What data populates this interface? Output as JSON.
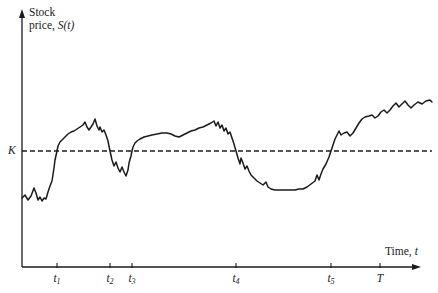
{
  "figure": {
    "name": "stock-price-path-with-strike-level",
    "background_color": "#ffffff",
    "line_color": "#1a1a1a",
    "width": 438,
    "height": 293
  },
  "axes": {
    "y_title_line1": "Stock",
    "y_title_line2_prefix": "price, ",
    "y_title_line2_symbol": "S(t)",
    "x_title_prefix": "Time, ",
    "x_title_symbol": "t",
    "strike_label": "K",
    "origin_x": 22,
    "origin_y": 267,
    "y_axis_top": 12,
    "x_axis_right": 420
  },
  "ticks": [
    {
      "label": "t",
      "sub": "1",
      "x": 57
    },
    {
      "label": "t",
      "sub": "2",
      "x": 110
    },
    {
      "label": "t",
      "sub": "3",
      "x": 132
    },
    {
      "label": "t",
      "sub": "4",
      "x": 236
    },
    {
      "label": "t",
      "sub": "5",
      "x": 331
    },
    {
      "label": "T",
      "sub": "",
      "x": 380
    }
  ],
  "strike_line": {
    "name": "strike-price-dashed-line",
    "y": 151,
    "x_start": 22,
    "x_end": 432,
    "dash": "5 3",
    "width": 1.6
  },
  "chart_data": {
    "type": "line",
    "title": "",
    "xlabel": "Time, t",
    "ylabel": "Stock price, S(t)",
    "legend": [],
    "grid": false,
    "annotations": [
      {
        "text": "K",
        "type": "horizontal-threshold",
        "y_pixel": 151
      },
      {
        "text": "t1",
        "type": "upcrossing",
        "x_pixel": 57
      },
      {
        "text": "t2",
        "type": "downcrossing",
        "x_pixel": 110
      },
      {
        "text": "t3",
        "type": "upcrossing",
        "x_pixel": 132
      },
      {
        "text": "t4",
        "type": "downcrossing",
        "x_pixel": 236
      },
      {
        "text": "t5",
        "type": "upcrossing",
        "x_pixel": 331
      },
      {
        "text": "T",
        "type": "maturity",
        "x_pixel": 380
      }
    ],
    "axis_note": "Axes are unlabeled qualitatively; values are pixel coordinates of the sampled path.",
    "path_points": [
      [
        22,
        198
      ],
      [
        25,
        195
      ],
      [
        28,
        200
      ],
      [
        31,
        196
      ],
      [
        34,
        188
      ],
      [
        36,
        193
      ],
      [
        38,
        200
      ],
      [
        40,
        197
      ],
      [
        42,
        201
      ],
      [
        44,
        198
      ],
      [
        46,
        199
      ],
      [
        48,
        192
      ],
      [
        50,
        186
      ],
      [
        52,
        181
      ],
      [
        54,
        168
      ],
      [
        55,
        160
      ],
      [
        57,
        151
      ],
      [
        58,
        146
      ],
      [
        60,
        142
      ],
      [
        62,
        140
      ],
      [
        65,
        137
      ],
      [
        68,
        134
      ],
      [
        71,
        132
      ],
      [
        74,
        131
      ],
      [
        77,
        129
      ],
      [
        80,
        127
      ],
      [
        83,
        125
      ],
      [
        85,
        122
      ],
      [
        87,
        127
      ],
      [
        89,
        130
      ],
      [
        91,
        127
      ],
      [
        93,
        124
      ],
      [
        95,
        119
      ],
      [
        97,
        126
      ],
      [
        99,
        130
      ],
      [
        100,
        127
      ],
      [
        102,
        132
      ],
      [
        104,
        130
      ],
      [
        106,
        135
      ],
      [
        108,
        141
      ],
      [
        110,
        151
      ],
      [
        112,
        160
      ],
      [
        114,
        166
      ],
      [
        116,
        162
      ],
      [
        118,
        168
      ],
      [
        120,
        172
      ],
      [
        122,
        167
      ],
      [
        124,
        172
      ],
      [
        126,
        176
      ],
      [
        128,
        170
      ],
      [
        129,
        163
      ],
      [
        131,
        156
      ],
      [
        132,
        151
      ],
      [
        133,
        147
      ],
      [
        135,
        143
      ],
      [
        137,
        141
      ],
      [
        140,
        139
      ],
      [
        144,
        137
      ],
      [
        148,
        136
      ],
      [
        152,
        135
      ],
      [
        157,
        134
      ],
      [
        162,
        133
      ],
      [
        167,
        133
      ],
      [
        171,
        134
      ],
      [
        175,
        136
      ],
      [
        179,
        137
      ],
      [
        183,
        135
      ],
      [
        187,
        133
      ],
      [
        191,
        131
      ],
      [
        195,
        130
      ],
      [
        199,
        128
      ],
      [
        203,
        127
      ],
      [
        207,
        125
      ],
      [
        211,
        123
      ],
      [
        214,
        121
      ],
      [
        216,
        126
      ],
      [
        218,
        122
      ],
      [
        220,
        128
      ],
      [
        222,
        125
      ],
      [
        224,
        131
      ],
      [
        226,
        128
      ],
      [
        228,
        134
      ],
      [
        230,
        132
      ],
      [
        232,
        138
      ],
      [
        234,
        144
      ],
      [
        236,
        151
      ],
      [
        238,
        158
      ],
      [
        240,
        164
      ],
      [
        241,
        158
      ],
      [
        243,
        163
      ],
      [
        245,
        169
      ],
      [
        247,
        166
      ],
      [
        249,
        171
      ],
      [
        251,
        175
      ],
      [
        254,
        178
      ],
      [
        257,
        181
      ],
      [
        260,
        183
      ],
      [
        263,
        185
      ],
      [
        266,
        182
      ],
      [
        268,
        187
      ],
      [
        271,
        189
      ],
      [
        275,
        190
      ],
      [
        280,
        190
      ],
      [
        285,
        190
      ],
      [
        290,
        190
      ],
      [
        295,
        190
      ],
      [
        299,
        189
      ],
      [
        303,
        189
      ],
      [
        307,
        187
      ],
      [
        311,
        184
      ],
      [
        315,
        181
      ],
      [
        317,
        175
      ],
      [
        319,
        180
      ],
      [
        321,
        174
      ],
      [
        323,
        169
      ],
      [
        326,
        164
      ],
      [
        329,
        157
      ],
      [
        331,
        151
      ],
      [
        333,
        145
      ],
      [
        335,
        139
      ],
      [
        337,
        135
      ],
      [
        339,
        131
      ],
      [
        341,
        135
      ],
      [
        344,
        133
      ],
      [
        347,
        132
      ],
      [
        350,
        136
      ],
      [
        353,
        133
      ],
      [
        356,
        128
      ],
      [
        359,
        123
      ],
      [
        362,
        119
      ],
      [
        365,
        117
      ],
      [
        369,
        116
      ],
      [
        372,
        115
      ],
      [
        375,
        118
      ],
      [
        378,
        116
      ],
      [
        381,
        112
      ],
      [
        384,
        110
      ],
      [
        387,
        113
      ],
      [
        390,
        110
      ],
      [
        393,
        106
      ],
      [
        396,
        103
      ],
      [
        399,
        107
      ],
      [
        402,
        104
      ],
      [
        405,
        101
      ],
      [
        408,
        105
      ],
      [
        411,
        108
      ],
      [
        414,
        105
      ],
      [
        418,
        102
      ],
      [
        422,
        104
      ],
      [
        426,
        101
      ],
      [
        430,
        100
      ],
      [
        432,
        102
      ]
    ]
  }
}
